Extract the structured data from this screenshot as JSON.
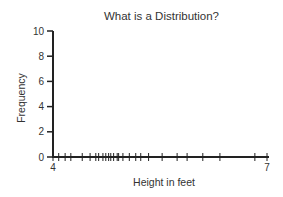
{
  "chart_data": {
    "type": "scatter",
    "title": "What is a Distribution?",
    "xlabel": "Height in feet",
    "ylabel": "Frequency",
    "xlim": [
      4,
      7
    ],
    "ylim": [
      0,
      10
    ],
    "x_tick_labels": [
      "4",
      "7"
    ],
    "y_tick_labels": [
      "0",
      "2",
      "4",
      "6",
      "8",
      "10"
    ],
    "grid": false,
    "legend": null,
    "series": [
      {
        "name": "height observations (rug marks on x-axis)",
        "x": [
          4.0,
          4.08,
          4.17,
          4.25,
          4.41,
          4.52,
          4.6,
          4.64,
          4.7,
          4.74,
          4.78,
          4.81,
          4.85,
          4.9,
          4.92,
          4.98,
          5.07,
          5.16,
          5.23,
          5.34,
          5.53,
          5.74,
          5.88,
          6.1,
          6.34,
          6.83,
          7.0
        ],
        "y": [
          0,
          0,
          0,
          0,
          0,
          0,
          0,
          0,
          0,
          0,
          0,
          0,
          0,
          0,
          0,
          0,
          0,
          0,
          0,
          0,
          0,
          0,
          0,
          0,
          0,
          0,
          0
        ]
      }
    ]
  },
  "colors": {
    "axis": "#222222",
    "text": "#333333",
    "background": "#ffffff"
  }
}
